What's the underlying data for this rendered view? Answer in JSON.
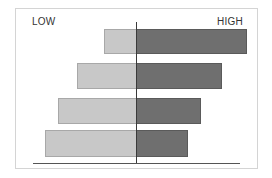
{
  "chart_data": {
    "type": "bar",
    "orientation": "horizontal-diverging",
    "title": "",
    "labels": {
      "left": "LOW",
      "right": "HIGH"
    },
    "categories": [
      "Row 1",
      "Row 2",
      "Row 3",
      "Row 4"
    ],
    "series": [
      {
        "name": "LOW",
        "color": "#c8c8c8",
        "values": [
          32,
          59,
          78,
          91
        ]
      },
      {
        "name": "HIGH",
        "color": "#6f6f6f",
        "values": [
          111,
          86,
          65,
          52
        ]
      }
    ],
    "grid": false,
    "legend": "none"
  },
  "layout": {
    "center_x": 136,
    "rows": [
      {
        "top": 29,
        "height": 25
      },
      {
        "top": 63,
        "height": 26
      },
      {
        "top": 98,
        "height": 26
      },
      {
        "top": 130,
        "height": 27
      }
    ]
  }
}
